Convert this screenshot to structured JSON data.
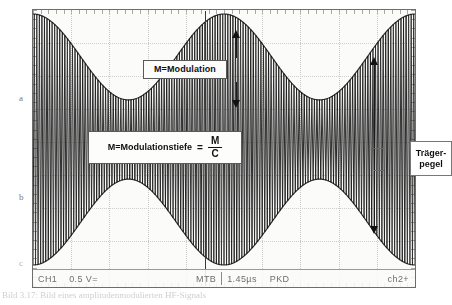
{
  "figure": {
    "kind": "oscilloscope-photo",
    "caption": "Bild 3.17: Bild eines amplitudenmodulierten HF-Signals"
  },
  "scope": {
    "status_bar": {
      "channel1": "CH1",
      "volts_div": "0.5 V=",
      "timebase_mode": "MTB",
      "time_div": "1.45µs",
      "acquisition": "PKD",
      "channel2": "ch2+"
    },
    "cursor_label": "centre-cursor"
  },
  "annotations": {
    "modulation": {
      "label": "M=Modulation"
    },
    "formula": {
      "left": "M=Modulationstiefe",
      "equals": "=",
      "numerator": "M",
      "denominator": "C"
    },
    "carrier": {
      "line1": "Träger-",
      "line2": "pegel"
    }
  },
  "side_labels": {
    "a": "a",
    "b": "b",
    "c": "c"
  },
  "chart_data": {
    "type": "area",
    "xlabel": "Zeit",
    "ylabel": "Spannung",
    "grid": true,
    "legend": "none",
    "horizontal_divisions": 10,
    "vertical_divisions": 8,
    "volts_per_div": 0.5,
    "time_per_div": "1.45µs",
    "carrier_center_level": 0.5,
    "envelope_peak": 0.95,
    "envelope_trough": 0.3,
    "modulation_index": 0.52,
    "envelope_cycles": 2,
    "carrier_cycles": 150,
    "x": [
      0,
      0.05,
      0.1,
      0.15,
      0.2,
      0.25,
      0.3,
      0.35,
      0.4,
      0.45,
      0.5,
      0.55,
      0.6,
      0.65,
      0.7,
      0.75,
      0.8,
      0.85,
      0.9,
      0.95,
      1.0
    ],
    "envelope_upper": [
      0.86,
      0.93,
      0.95,
      0.92,
      0.84,
      0.73,
      0.62,
      0.53,
      0.47,
      0.45,
      0.46,
      0.52,
      0.62,
      0.74,
      0.85,
      0.93,
      0.95,
      0.92,
      0.84,
      0.74,
      0.66
    ],
    "envelope_lower": [
      0.14,
      0.07,
      0.05,
      0.08,
      0.16,
      0.27,
      0.38,
      0.47,
      0.53,
      0.55,
      0.54,
      0.48,
      0.38,
      0.26,
      0.15,
      0.07,
      0.05,
      0.08,
      0.16,
      0.26,
      0.34
    ]
  }
}
